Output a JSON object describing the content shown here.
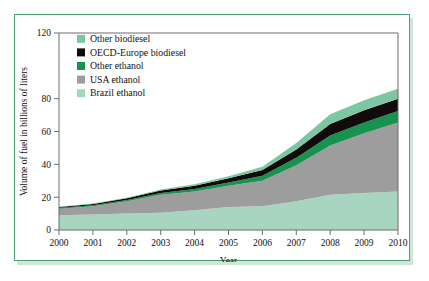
{
  "chart_data": {
    "type": "area",
    "stacked": true,
    "title": "",
    "xlabel": "Year",
    "ylabel": "Volume of fuel in billions of liters",
    "categories": [
      "2000",
      "2001",
      "2002",
      "2003",
      "2004",
      "2005",
      "2006",
      "2007",
      "2008",
      "2009",
      "2010"
    ],
    "x": [
      2000,
      2001,
      2002,
      2003,
      2004,
      2005,
      2006,
      2007,
      2008,
      2009,
      2010
    ],
    "xlim": [
      2000,
      2010
    ],
    "ylim": [
      0,
      120
    ],
    "yticks": [
      0,
      20,
      40,
      60,
      80,
      120
    ],
    "ytick_labels": [
      "0",
      "20",
      "40",
      "60",
      "80",
      "120"
    ],
    "grid": false,
    "legend_position": "top-left-inside",
    "series": [
      {
        "name": "Brazil ethanol",
        "color": "#a8d5c0",
        "values": [
          9.0,
          9.5,
          10.0,
          10.5,
          12.0,
          14.0,
          14.5,
          17.5,
          21.5,
          22.5,
          23.5
        ]
      },
      {
        "name": "USA ethanol",
        "color": "#9d9d9d",
        "values": [
          4.0,
          5.0,
          7.5,
          11.0,
          11.5,
          13.0,
          15.5,
          22.0,
          30.0,
          36.5,
          42.0
        ]
      },
      {
        "name": "Other ethanol",
        "color": "#17924f",
        "values": [
          0.5,
          0.6,
          0.8,
          1.0,
          1.5,
          2.0,
          3.0,
          4.5,
          6.0,
          6.5,
          7.0
        ]
      },
      {
        "name": "OECD-Europe biodiesel",
        "color": "#120b0b",
        "values": [
          0.5,
          0.8,
          1.0,
          1.5,
          2.0,
          2.5,
          3.5,
          5.0,
          7.0,
          7.5,
          7.5
        ]
      },
      {
        "name": "Other biodiesel",
        "color": "#7dc6a4",
        "values": [
          0.2,
          0.3,
          0.4,
          0.6,
          0.9,
          1.3,
          2.0,
          4.0,
          6.0,
          6.0,
          6.0
        ]
      }
    ],
    "cumulative_totals": [
      14.2,
      16.2,
      19.7,
      24.6,
      27.9,
      32.8,
      38.5,
      53.0,
      70.5,
      79.0,
      86.0
    ],
    "legend_order_displayed": [
      "Other biodiesel",
      "OECD-Europe biodiesel",
      "Other ethanol",
      "USA ethanol",
      "Brazil ethanol"
    ]
  },
  "figure": {
    "frame_color": "#4e9e74",
    "shadow_color": "#cfe5d8",
    "background": "#ffffff",
    "axis_color": "#6d6d6d"
  },
  "axes": {
    "y_title": "Volume of fuel in billions of liters",
    "x_title": "Year",
    "y_ticks": [
      "0",
      "20",
      "40",
      "60",
      "80",
      "120"
    ],
    "x_ticks": [
      "2000",
      "2001",
      "2002",
      "2003",
      "2004",
      "2005",
      "2006",
      "2007",
      "2008",
      "2009",
      "2010"
    ]
  },
  "legend": {
    "items": [
      {
        "label": "Other biodiesel",
        "color": "#7dc6a4"
      },
      {
        "label": "OECD-Europe biodiesel",
        "color": "#120b0b"
      },
      {
        "label": "Other ethanol",
        "color": "#17924f"
      },
      {
        "label": "USA ethanol",
        "color": "#9d9d9d"
      },
      {
        "label": "Brazil ethanol",
        "color": "#a8d5c0"
      }
    ]
  }
}
